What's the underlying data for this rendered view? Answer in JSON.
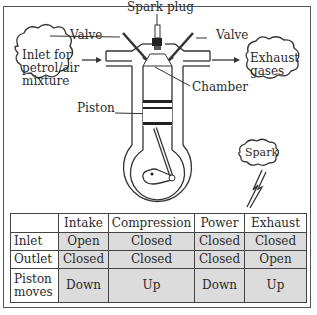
{
  "diagram": {
    "labels": {
      "spark_plug": "Spark plug",
      "valve_left": "Valve",
      "valve_right": "Valve",
      "chamber": "Chamber",
      "piston": "Piston"
    },
    "clouds": {
      "inlet": [
        "Inlet for",
        "petrol/air",
        "mixture"
      ],
      "exhaust": [
        "Exhaust",
        "gases"
      ],
      "spark": "Spark"
    },
    "colors": {
      "line": "#333333",
      "table_shade": "#dcdcdc",
      "frame": "#555555"
    }
  },
  "table": {
    "columns": [
      "",
      "Intake",
      "Compression",
      "Power",
      "Exhaust"
    ],
    "rows": [
      {
        "label": "Inlet",
        "values": [
          "Open",
          "Closed",
          "Closed",
          "Closed"
        ]
      },
      {
        "label": "Outlet",
        "values": [
          "Closed",
          "Closed",
          "Closed",
          "Open"
        ]
      },
      {
        "label_lines": [
          "Piston",
          "moves"
        ],
        "values": [
          "Down",
          "Up",
          "Down",
          "Up"
        ]
      }
    ]
  }
}
